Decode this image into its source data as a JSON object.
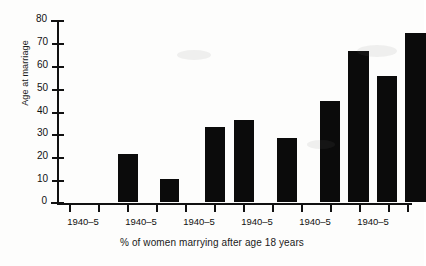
{
  "chart_data": {
    "type": "bar",
    "title": "",
    "subtitle": "",
    "xlabel": "% of women marrying after age 18 years",
    "ylabel": "Age at marriage",
    "ylim": [
      0,
      80
    ],
    "yticks": [
      0,
      10,
      20,
      30,
      40,
      50,
      60,
      70,
      80
    ],
    "ytick_labels": [
      "0",
      "10",
      "20",
      "30",
      "40",
      "50",
      "60",
      "70",
      "80"
    ],
    "grid": false,
    "legend": null,
    "legend_position": "none",
    "xtick_labels": [
      "1940–5",
      "1940–5",
      "1940–5",
      "1940–5",
      "1940–5",
      "1940–5"
    ],
    "categories": [
      "1",
      "2",
      "3",
      "4",
      "5",
      "6",
      "7",
      "8",
      "9",
      "10",
      "11",
      "12"
    ],
    "values": [
      0,
      0,
      21,
      10,
      0,
      33,
      36,
      28,
      44,
      66,
      55,
      74
    ],
    "bars": [
      {
        "index": 1,
        "value": 0,
        "visible": false
      },
      {
        "index": 2,
        "value": 0,
        "visible": false
      },
      {
        "index": 3,
        "value": 21,
        "visible": true
      },
      {
        "index": 4,
        "value": 10,
        "visible": true
      },
      {
        "index": 5,
        "value": 0,
        "visible": false
      },
      {
        "index": 6,
        "value": 33,
        "visible": true
      },
      {
        "index": 7,
        "value": 36,
        "visible": true
      },
      {
        "index": 8,
        "value": 28,
        "visible": true
      },
      {
        "index": 9,
        "value": 44,
        "visible": true
      },
      {
        "index": 10,
        "value": 66,
        "visible": true
      },
      {
        "index": 11,
        "value": 55,
        "visible": true
      },
      {
        "index": 12,
        "value": 74,
        "visible": true
      }
    ],
    "bar_color": "#0b0b0b",
    "axis_color": "#111111",
    "background_color": "#ffffff"
  }
}
